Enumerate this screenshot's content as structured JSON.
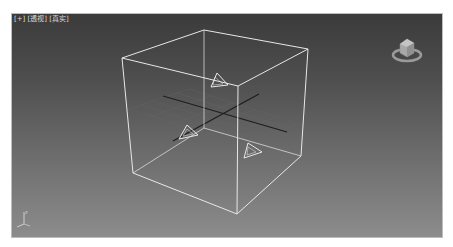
{
  "viewport": {
    "label_parts": [
      "[+]",
      "[透视]",
      "[真实]"
    ],
    "view_name": "透视",
    "shading_mode": "真实",
    "background_top": "#3b3b3b",
    "background_bottom": "#8c8c8c",
    "wire_color": "#e6e6e6",
    "grid_axis_color": "#1e1e1e"
  },
  "scene": {
    "objects": [
      {
        "type": "box-wireframe",
        "name": "cube"
      },
      {
        "type": "light-gizmo",
        "name": "light-1"
      },
      {
        "type": "light-gizmo",
        "name": "light-2"
      },
      {
        "type": "light-gizmo",
        "name": "light-3"
      }
    ],
    "home_grid": true
  },
  "viewcube": {
    "icon": "viewcube-icon"
  },
  "axis_tripod": {
    "icon": "axis-tripod-icon",
    "labels": [
      "z",
      "x"
    ]
  }
}
